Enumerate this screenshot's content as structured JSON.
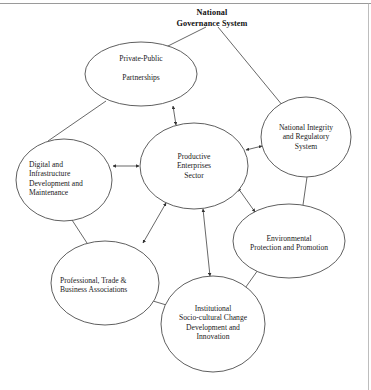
{
  "figure": {
    "title": "National\nGovernance System",
    "title_lines": [
      "National",
      "Governance System"
    ],
    "border": {
      "top_rule": true,
      "right_rule": true,
      "rule_color": "#9a9a9a"
    },
    "palette": {
      "stroke": "#4d4d4d",
      "fill": "#ffffff",
      "text": "#1a1a1a",
      "background": "#ffffff"
    }
  },
  "nodes": [
    {
      "id": "private-public-partnerships",
      "label": "Private-Public\n\nPartnerships",
      "lines": [
        "Private-Public",
        "",
        "Partnerships"
      ],
      "align": "center",
      "cx": 141,
      "cy": 74,
      "rx": 56,
      "ry": 32,
      "font_size": 7.6
    },
    {
      "id": "productive-enterprises-sector",
      "label": "Productive\nEnterprises\nSector",
      "lines": [
        "Productive",
        "Enterprises",
        "Sector"
      ],
      "align": "center",
      "cx": 194,
      "cy": 166,
      "rx": 54,
      "ry": 43,
      "font_size": 7.6
    },
    {
      "id": "national-integrity-regulatory-system",
      "label": "National Integrity\nand Regulatory\nSystem",
      "lines": [
        "National Integrity",
        "and Regulatory",
        "System"
      ],
      "align": "center",
      "cx": 306,
      "cy": 137,
      "rx": 45,
      "ry": 40,
      "font_size": 7.6
    },
    {
      "id": "digital-infrastructure-development-maintenance",
      "label": "Digital and\nInfrastructure\nDevelopment and\nMaintenance",
      "lines": [
        "Digital and",
        "Infrastructure",
        "Development and",
        "Maintenance"
      ],
      "align": "left",
      "cx": 64,
      "cy": 180,
      "rx": 48,
      "ry": 41,
      "font_size": 7.6
    },
    {
      "id": "environmental-protection-promotion",
      "label": "Environmental\nProtection and Promotion",
      "lines": [
        "Environmental",
        "Protection and Promotion"
      ],
      "align": "center",
      "cx": 289,
      "cy": 241,
      "rx": 56,
      "ry": 37,
      "font_size": 7.6
    },
    {
      "id": "professional-trade-business-associations",
      "label": "Professional, Trade &\nBusiness Associations",
      "lines": [
        "Professional, Trade &",
        "Business Associations"
      ],
      "align": "left",
      "cx": 105,
      "cy": 283,
      "rx": 54,
      "ry": 42,
      "font_size": 7.6
    },
    {
      "id": "institutional-socio-cultural-change",
      "label": "Institutional\nSocio-cultural Change\nDevelopment and\nInnovation",
      "lines": [
        "Institutional",
        "Socio-cultural Change",
        "Development and",
        "Innovation"
      ],
      "align": "center",
      "cx": 213,
      "cy": 324,
      "rx": 52,
      "ry": 48,
      "font_size": 7.6
    }
  ],
  "connectors": [
    {
      "id": "title-to-private-public",
      "from": "national-governance-system-title",
      "to": "private-public-partnerships",
      "arrow": "none"
    },
    {
      "id": "title-to-national-integrity",
      "from": "national-governance-system-title",
      "to": "national-integrity-regulatory-system",
      "arrow": "none"
    },
    {
      "id": "private-public-to-productive",
      "from": "private-public-partnerships",
      "to": "productive-enterprises-sector",
      "arrow": "double"
    },
    {
      "id": "private-public-to-digital",
      "from": "private-public-partnerships",
      "to": "digital-infrastructure-development-maintenance",
      "arrow": "none"
    },
    {
      "id": "digital-to-productive",
      "from": "digital-infrastructure-development-maintenance",
      "to": "productive-enterprises-sector",
      "arrow": "double"
    },
    {
      "id": "digital-to-professional",
      "from": "digital-infrastructure-development-maintenance",
      "to": "professional-trade-business-associations",
      "arrow": "none"
    },
    {
      "id": "professional-to-productive",
      "from": "professional-trade-business-associations",
      "to": "productive-enterprises-sector",
      "arrow": "double"
    },
    {
      "id": "productive-to-institutional",
      "from": "productive-enterprises-sector",
      "to": "institutional-socio-cultural-change",
      "arrow": "double"
    },
    {
      "id": "productive-to-national-integrity",
      "from": "productive-enterprises-sector",
      "to": "national-integrity-regulatory-system",
      "arrow": "double"
    },
    {
      "id": "productive-to-environmental",
      "from": "productive-enterprises-sector",
      "to": "environmental-protection-promotion",
      "arrow": "double"
    },
    {
      "id": "national-integrity-to-environmental",
      "from": "national-integrity-regulatory-system",
      "to": "environmental-protection-promotion",
      "arrow": "none"
    },
    {
      "id": "environmental-to-institutional",
      "from": "environmental-protection-promotion",
      "to": "institutional-socio-cultural-change",
      "arrow": "none"
    },
    {
      "id": "professional-to-institutional",
      "from": "professional-trade-business-associations",
      "to": "institutional-socio-cultural-change",
      "arrow": "none"
    }
  ]
}
